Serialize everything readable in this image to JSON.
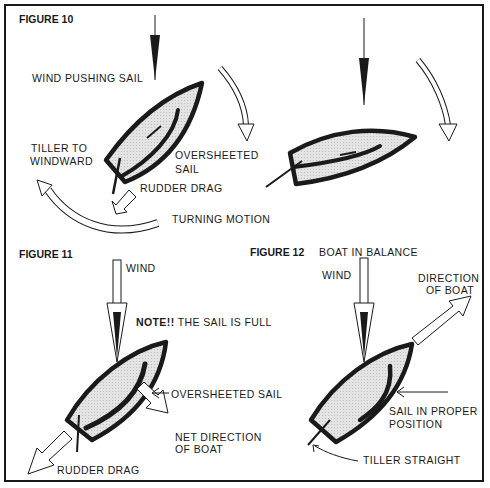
{
  "figure10": {
    "title": "FIGURE 10",
    "labels": {
      "wind": "WIND PUSHING SAIL",
      "tiller_1": "TILLER TO",
      "tiller_2": "WINDWARD",
      "oversheeted_1": "OVERSHEETED",
      "oversheeted_2": "SAIL",
      "rudder": "RUDDER DRAG",
      "turning": "TURNING MOTION"
    }
  },
  "figure11": {
    "title": "FIGURE 11",
    "labels": {
      "wind": "WIND",
      "note_bold": "NOTE!!",
      "note_rest": "THE SAIL IS FULL",
      "oversheeted": "OVERSHEETED SAIL",
      "net_1": "NET DIRECTION",
      "net_2": "OF BOAT",
      "rudder": "RUDDER DRAG"
    }
  },
  "figure12": {
    "title": "FIGURE 12",
    "subtitle": "BOAT IN BALANCE",
    "labels": {
      "wind": "WIND",
      "direction_1": "DIRECTION",
      "direction_2": "OF BOAT",
      "sail_1": "SAIL IN PROPER",
      "sail_2": "POSITION",
      "tiller": "TILLER STRAIGHT"
    }
  },
  "colors": {
    "ink": "#1a1a1a",
    "hull_fill": "#dedede",
    "paper": "#ffffff"
  }
}
